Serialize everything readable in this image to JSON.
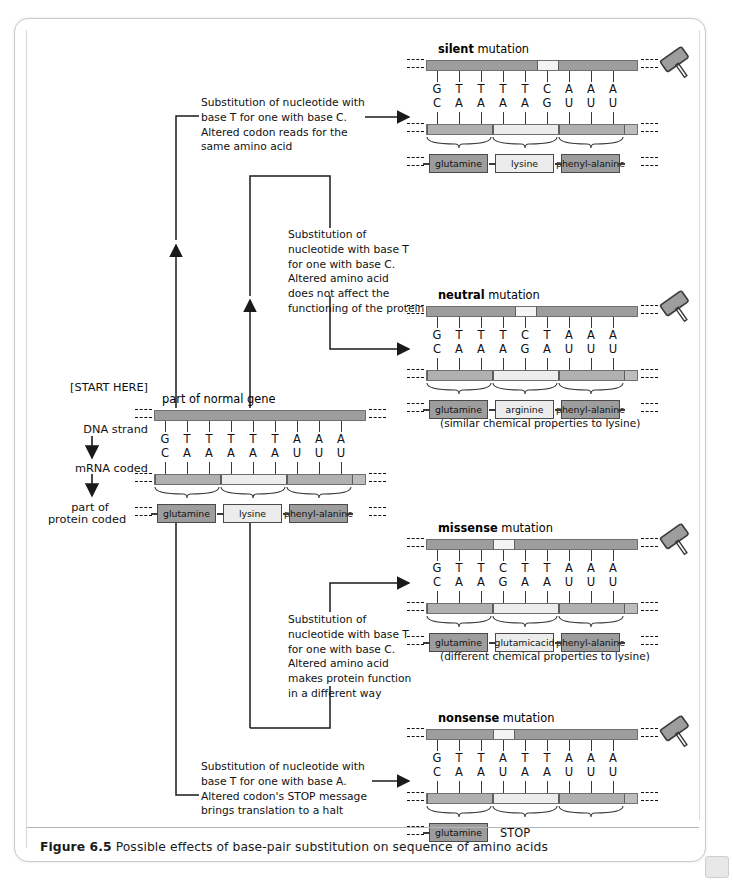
{
  "figure": {
    "number": "Figure 6.5",
    "caption": "Possible effects of base-pair substitution on sequence of amino acids"
  },
  "start_labels": {
    "start_here": "[START HERE]",
    "dna_strand": "DNA strand",
    "mrna_coded": "mRNA coded",
    "protein_coded_line1": "part of",
    "protein_coded_line2": "protein coded"
  },
  "icons": {
    "hammer": "hammer-icon",
    "arrow": "arrow-right-icon"
  },
  "normal": {
    "title": "part of normal gene",
    "dna_bases": [
      "G",
      "T",
      "T",
      "T",
      "T",
      "T",
      "A",
      "A",
      "A"
    ],
    "mrna_bases": [
      "C",
      "A",
      "A",
      "A",
      "A",
      "A",
      "U",
      "U",
      "U"
    ],
    "amino_acids": [
      "glutamine",
      "lysine",
      "phenyl-\nalanine"
    ]
  },
  "panels": [
    {
      "id": "silent",
      "title_bold": "silent",
      "title_rest": " mutation",
      "dna_bases": [
        "G",
        "T",
        "T",
        "T",
        "T",
        "C",
        "A",
        "A",
        "A"
      ],
      "mrna_bases": [
        "C",
        "A",
        "A",
        "A",
        "A",
        "G",
        "U",
        "U",
        "U"
      ],
      "amino_acids": [
        "glutamine",
        "lysine",
        "phenyl-\nalanine"
      ],
      "mutated_index": 5,
      "note": ""
    },
    {
      "id": "neutral",
      "title_bold": "neutral",
      "title_rest": " mutation",
      "dna_bases": [
        "G",
        "T",
        "T",
        "T",
        "C",
        "T",
        "A",
        "A",
        "A"
      ],
      "mrna_bases": [
        "C",
        "A",
        "A",
        "A",
        "G",
        "A",
        "U",
        "U",
        "U"
      ],
      "amino_acids": [
        "glutamine",
        "arginine",
        "phenyl-\nalanine"
      ],
      "mutated_index": 4,
      "note": "(similar chemical\nproperties to lysine)"
    },
    {
      "id": "missense",
      "title_bold": "missense",
      "title_rest": " mutation",
      "dna_bases": [
        "G",
        "T",
        "T",
        "C",
        "T",
        "T",
        "A",
        "A",
        "A"
      ],
      "mrna_bases": [
        "C",
        "A",
        "A",
        "G",
        "A",
        "A",
        "U",
        "U",
        "U"
      ],
      "amino_acids": [
        "glutamine",
        "glutamic\nacid",
        "phenyl-\nalanine"
      ],
      "mutated_index": 3,
      "note": "(different chemical\nproperties to lysine)"
    },
    {
      "id": "nonsense",
      "title_bold": "nonsense",
      "title_rest": " mutation",
      "dna_bases": [
        "G",
        "T",
        "T",
        "A",
        "T",
        "T",
        "A",
        "A",
        "A"
      ],
      "mrna_bases": [
        "C",
        "A",
        "A",
        "U",
        "A",
        "A",
        "U",
        "U",
        "U"
      ],
      "amino_acids": [
        "glutamine"
      ],
      "stop_label": "STOP",
      "mutated_index": 3,
      "note": ""
    }
  ],
  "descriptions": {
    "silent": "Substitution of nucleotide with\nbase T for one with base C.\nAltered codon reads for the\nsame amino acid",
    "neutral": "Substitution of\nnucleotide with base T\nfor one with base C.\nAltered amino acid\ndoes not affect the\nfunctioning of the protein",
    "missense": "Substitution of\nnucleotide with base T\nfor one with base C.\nAltered amino acid\nmakes protein function\nin a different way",
    "nonsense": "Substitution of nucleotide with\nbase T for one with base A.\nAltered codon's STOP message\nbrings translation to a halt"
  },
  "colors": {
    "bar_dark": "#9d9d9d",
    "bar_light": "#e9e9e9",
    "mutated_segment": "#f4f4f4",
    "outline": "#6f6f6f",
    "text": "#111111"
  }
}
